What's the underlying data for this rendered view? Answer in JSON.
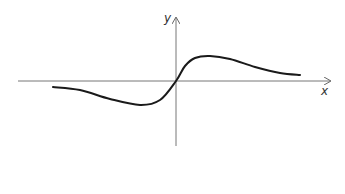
{
  "chart_data": {
    "type": "line",
    "title": "",
    "xlabel": "x",
    "ylabel": "y",
    "grid": false,
    "legend": null,
    "axes": {
      "origin_px": [
        176,
        81
      ],
      "x_axis_px": {
        "start": 18,
        "end": 330
      },
      "y_axis_px": {
        "top": 18,
        "bottom": 146
      },
      "ticks": "none"
    },
    "series": [
      {
        "name": "f(x)",
        "description": "Smooth curve: slight negative values on left decreasing to a minimum just left of origin, crossing origin with steep positive slope, peak just right of origin, then decaying toward zero from above.",
        "points_px": [
          [
            53,
            87
          ],
          [
            80,
            90
          ],
          [
            110,
            99
          ],
          [
            140,
            105
          ],
          [
            160,
            100
          ],
          [
            176,
            81
          ],
          [
            185,
            66
          ],
          [
            195,
            58
          ],
          [
            210,
            56
          ],
          [
            230,
            59
          ],
          [
            255,
            67
          ],
          [
            280,
            73
          ],
          [
            300,
            75
          ]
        ],
        "features": {
          "local_min_px": [
            143,
            105
          ],
          "zero_crossing_px": [
            176,
            81
          ],
          "local_max_px": [
            210,
            56
          ]
        }
      }
    ],
    "colors": {
      "curve": "#1a1a1a",
      "axes": "#666666"
    }
  },
  "labels": {
    "x_axis": "x",
    "y_axis": "y"
  }
}
